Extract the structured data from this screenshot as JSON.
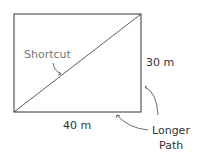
{
  "diagram": {
    "shortcut_label": "Shortcut",
    "height_label": "30 m",
    "width_label": "40 m",
    "longer_label_line1": "Longer",
    "longer_label_line2": "Path",
    "colors": {
      "line": "#333333",
      "shortcut_text": "#777777",
      "text": "#333333"
    }
  }
}
